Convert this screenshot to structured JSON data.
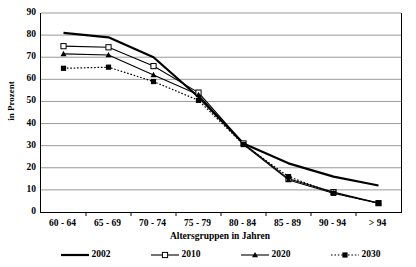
{
  "chart_data": {
    "type": "line",
    "title": "",
    "xlabel": "Altersgruppen in Jahren",
    "ylabel": "in Prozent",
    "categories": [
      "60 - 64",
      "65 - 69",
      "70 - 74",
      "75 - 79",
      "80 - 84",
      "85 - 89",
      "90 - 94",
      "> 94"
    ],
    "ylim": [
      0,
      90
    ],
    "yticks": [
      0,
      10,
      20,
      30,
      40,
      50,
      60,
      70,
      80,
      90
    ],
    "grid": "horizontal",
    "legend_position": "bottom",
    "series": [
      {
        "name": "2002",
        "values": [
          81,
          79,
          70,
          52,
          31,
          22,
          16,
          12
        ],
        "marker": "none",
        "dash": "solid",
        "width": 2.2
      },
      {
        "name": "2010",
        "values": [
          75,
          74.5,
          66,
          54,
          31,
          15,
          9,
          4
        ],
        "marker": "open-square",
        "dash": "solid",
        "width": 1.1
      },
      {
        "name": "2020",
        "values": [
          71.5,
          71,
          62,
          53,
          30.5,
          14.5,
          8.5,
          4
        ],
        "marker": "filled-triangle",
        "dash": "solid",
        "width": 1.1
      },
      {
        "name": "2030",
        "values": [
          65,
          65.5,
          59,
          50.5,
          30.5,
          16,
          8.5,
          4
        ],
        "marker": "filled-square",
        "dash": "dotted",
        "width": 1.2
      }
    ]
  },
  "legend": {
    "items": [
      {
        "label": "2002"
      },
      {
        "label": "2010"
      },
      {
        "label": "2020"
      },
      {
        "label": "2030"
      }
    ]
  },
  "axes": {
    "y_tick_labels": [
      "90",
      "80",
      "70",
      "60",
      "50",
      "40",
      "30",
      "20",
      "10",
      "0"
    ],
    "x_tick_labels": [
      "60 - 64",
      "65 - 69",
      "70 - 74",
      "75 - 79",
      "80 - 84",
      "85 - 89",
      "90 - 94",
      "> 94"
    ],
    "y_axis_title": "in Prozent",
    "x_axis_title": "Altersgruppen in Jahren"
  },
  "colors": {
    "line": "#000000",
    "grid": "#808080",
    "background": "#ffffff"
  }
}
